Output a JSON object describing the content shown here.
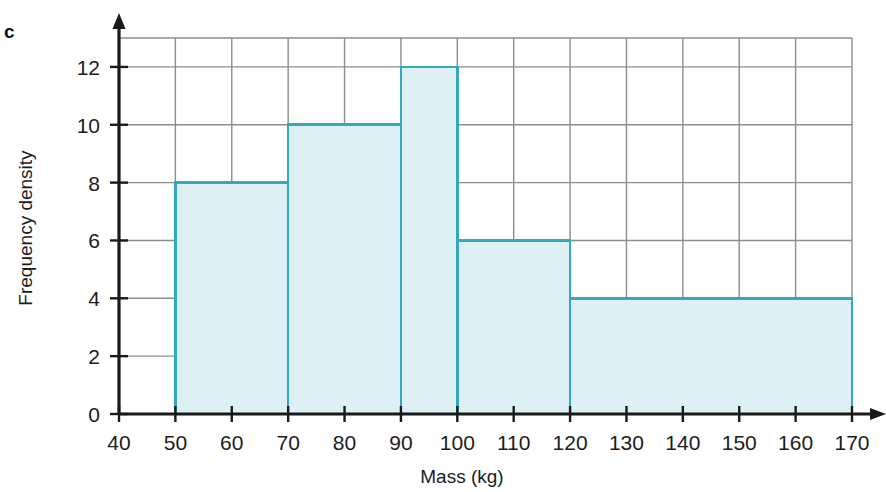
{
  "figure": {
    "panel_label": "c",
    "colors": {
      "bar_fill": "#ddf1f5",
      "bar_stroke": "#35a8bd",
      "gridline": "#8d8d8d",
      "axis": "#1a1a1a",
      "text": "#1c1c1c",
      "background": "#ffffff"
    }
  },
  "chart_data": {
    "type": "bar",
    "title": "",
    "subtitle": "",
    "xlabel": "Mass (kg)",
    "ylabel": "Frequency density",
    "xlim": [
      40,
      170
    ],
    "ylim": [
      0,
      13
    ],
    "grid": true,
    "legend": "none",
    "x_ticks": [
      40,
      50,
      60,
      70,
      80,
      90,
      100,
      110,
      120,
      130,
      140,
      150,
      160,
      170
    ],
    "x_tick_labels": [
      "40",
      "50",
      "60",
      "70",
      "80",
      "90",
      "100",
      "110",
      "120",
      "130",
      "140",
      "150",
      "160",
      "170"
    ],
    "y_ticks": [
      0,
      2,
      4,
      6,
      8,
      10,
      12
    ],
    "y_tick_labels": [
      "0",
      "2",
      "4",
      "6",
      "8",
      "10",
      "12"
    ],
    "bins": [
      {
        "label": "50-70",
        "start": 50,
        "end": 70,
        "value": 8
      },
      {
        "label": "70-90",
        "start": 70,
        "end": 90,
        "value": 10
      },
      {
        "label": "90-100",
        "start": 90,
        "end": 100,
        "value": 12
      },
      {
        "label": "100-120",
        "start": 100,
        "end": 120,
        "value": 6
      },
      {
        "label": "120-170",
        "start": 120,
        "end": 170,
        "value": 4
      }
    ],
    "categories": [
      "50-70",
      "70-90",
      "90-100",
      "100-120",
      "120-170"
    ],
    "values": [
      8,
      10,
      12,
      6,
      4
    ]
  }
}
